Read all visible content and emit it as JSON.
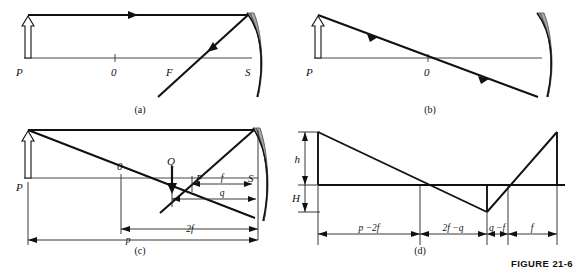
{
  "figure": {
    "caption": "FIGURE 21-6",
    "panels": [
      {
        "id": "a",
        "label": "(a)"
      },
      {
        "id": "b",
        "label": "(b)"
      },
      {
        "id": "c",
        "label": "(c)"
      },
      {
        "id": "d",
        "label": "(d)"
      }
    ]
  },
  "panel_a": {
    "point_P": "P",
    "point_O": "0",
    "point_F": "F",
    "point_S": "S"
  },
  "panel_b": {
    "point_P": "P",
    "point_O": "0"
  },
  "panel_c": {
    "point_P": "P",
    "point_O": "0",
    "point_Q": "Q",
    "point_F": "F",
    "point_S": "S",
    "dim_p": "p",
    "dim_2f": "2f",
    "dim_q": "q",
    "dim_f": "f"
  },
  "panel_d": {
    "height_h": "h",
    "height_H": "H",
    "dim_p_minus_2f": "p −2f",
    "dim_2f_minus_q": "2f −q",
    "dim_q_minus_f": "q −f",
    "dim_f": "f"
  },
  "colors": {
    "ink": "#111111",
    "mirror_shade": "#a9a9a9",
    "background": "#ffffff"
  }
}
